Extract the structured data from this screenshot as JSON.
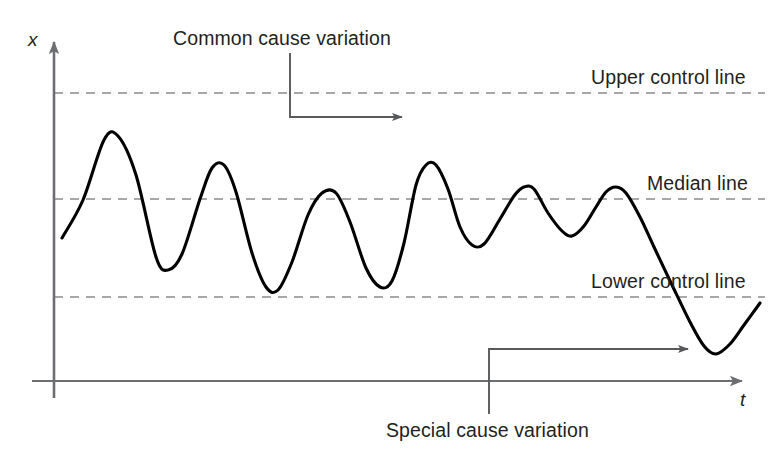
{
  "figure": {
    "background_color": "#ffffff",
    "width": 777,
    "height": 463
  },
  "axes": {
    "y_label": "x",
    "x_label": "t",
    "axis_color": "#6d6e71",
    "origin_x": 54,
    "origin_y": 381
  },
  "annotations": {
    "common_cause": "Common cause variation",
    "special_cause": "Special cause variation"
  },
  "control_lines": {
    "upper_label": "Upper control line",
    "median_label": "Median line",
    "lower_label": "Lower control line",
    "dash_color": "#8c8c8c",
    "upper_y": 93,
    "median_y": 199,
    "lower_y": 297
  },
  "series": {
    "name": "process-measurement",
    "color": "#000000",
    "stroke_width": 3.1
  },
  "chart_data": {
    "type": "line",
    "title": "",
    "xlabel": "t",
    "ylabel": "x",
    "grid": false,
    "legend": "none",
    "xlim": [
      54,
      765
    ],
    "ylim_pixels": [
      381,
      40
    ],
    "reference_lines": [
      {
        "name": "Upper control line",
        "y": 93,
        "style": "dashed",
        "color": "#8c8c8c"
      },
      {
        "name": "Median line",
        "y": 199,
        "style": "dashed",
        "color": "#8c8c8c"
      },
      {
        "name": "Lower control line",
        "y": 297,
        "style": "dashed",
        "color": "#8c8c8c"
      }
    ],
    "annotations": [
      {
        "text": "Common cause variation",
        "text_x": 173,
        "text_y": 29,
        "leader": {
          "from_x": 290,
          "from_y": 53,
          "elbow_y": 117,
          "to_x": 408,
          "to_y": 117
        },
        "points_to": "tallest peak near upper control line"
      },
      {
        "text": "Special cause variation",
        "text_x": 386,
        "text_y": 421,
        "leader": {
          "from_x": 489,
          "from_y": 412,
          "elbow_y": 349,
          "to_x": 694,
          "to_y": 349
        },
        "points_to": "trough below lower control line"
      }
    ],
    "series": [
      {
        "name": "process-measurement",
        "color": "#000000",
        "description": "Oscillating process measurement that stays between control limits then drifts below the lower control line",
        "points": [
          [
            62,
            238
          ],
          [
            83,
            200
          ],
          [
            104,
            140
          ],
          [
            118,
            136
          ],
          [
            136,
            175
          ],
          [
            156,
            257
          ],
          [
            168,
            270
          ],
          [
            182,
            254
          ],
          [
            200,
            199
          ],
          [
            212,
            168
          ],
          [
            224,
            165
          ],
          [
            236,
            192
          ],
          [
            252,
            253
          ],
          [
            266,
            287
          ],
          [
            278,
            290
          ],
          [
            292,
            262
          ],
          [
            308,
            215
          ],
          [
            322,
            193
          ],
          [
            336,
            193
          ],
          [
            350,
            222
          ],
          [
            366,
            268
          ],
          [
            380,
            287
          ],
          [
            392,
            281
          ],
          [
            404,
            243
          ],
          [
            416,
            185
          ],
          [
            426,
            165
          ],
          [
            436,
            165
          ],
          [
            448,
            189
          ],
          [
            460,
            227
          ],
          [
            472,
            245
          ],
          [
            484,
            244
          ],
          [
            500,
            219
          ],
          [
            514,
            196
          ],
          [
            524,
            187
          ],
          [
            534,
            189
          ],
          [
            548,
            213
          ],
          [
            562,
            231
          ],
          [
            572,
            236
          ],
          [
            584,
            226
          ],
          [
            596,
            207
          ],
          [
            606,
            192
          ],
          [
            616,
            187
          ],
          [
            626,
            193
          ],
          [
            640,
            217
          ],
          [
            654,
            247
          ],
          [
            672,
            285
          ],
          [
            690,
            322
          ],
          [
            704,
            346
          ],
          [
            716,
            354
          ],
          [
            730,
            344
          ],
          [
            744,
            325
          ],
          [
            760,
            303
          ]
        ]
      }
    ]
  }
}
